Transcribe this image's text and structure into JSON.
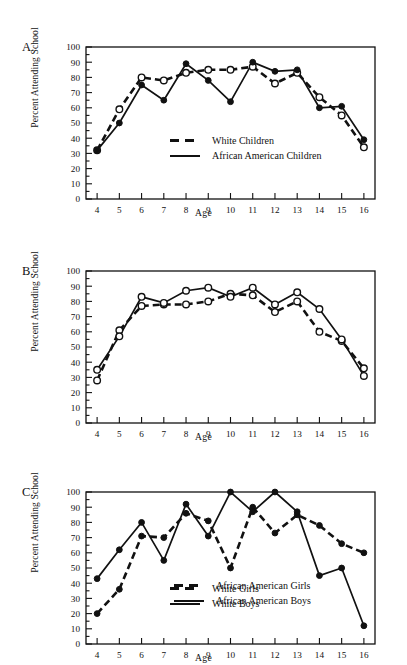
{
  "figure": {
    "panels": [
      {
        "letter": "A.",
        "ylabel": "Percent Attending School",
        "xlabel": "Age"
      },
      {
        "letter": "B.",
        "ylabel": "Percent Attending School",
        "xlabel": "Age"
      },
      {
        "letter": "C.",
        "ylabel": "Percent Attending School",
        "xlabel": "Age"
      }
    ]
  },
  "chart_data": [
    {
      "type": "line",
      "panel": "A.",
      "title": "",
      "xlabel": "Age",
      "ylabel": "Percent Attending School",
      "x": [
        4,
        5,
        6,
        7,
        8,
        9,
        10,
        11,
        12,
        13,
        14,
        15,
        16
      ],
      "xticklabels": [
        "4",
        "5",
        "6",
        "7",
        "8",
        "9",
        "10",
        "11",
        "12",
        "13",
        "14",
        "15",
        "16"
      ],
      "yticklabels": [
        "0",
        "10",
        "20",
        "30",
        "40",
        "50",
        "60",
        "70",
        "80",
        "90",
        "100"
      ],
      "xlim": [
        3.5,
        16.5
      ],
      "ylim": [
        0,
        100
      ],
      "grid": false,
      "legend_position": "center",
      "series": [
        {
          "name": "White Children",
          "style": "dashed",
          "marker": "open-circle",
          "values": [
            32,
            59,
            80,
            78,
            83,
            85,
            85,
            87,
            76,
            83,
            67,
            55,
            34
          ]
        },
        {
          "name": "African American Children",
          "style": "solid",
          "marker": "filled-circle",
          "values": [
            32,
            50,
            75,
            65,
            89,
            78,
            64,
            90,
            84,
            85,
            60,
            61,
            39
          ]
        }
      ]
    },
    {
      "type": "line",
      "panel": "B.",
      "title": "",
      "xlabel": "Age",
      "ylabel": "Percent Attending School",
      "x": [
        4,
        5,
        6,
        7,
        8,
        9,
        10,
        11,
        12,
        13,
        14,
        15,
        16
      ],
      "xticklabels": [
        "4",
        "5",
        "6",
        "7",
        "8",
        "9",
        "10",
        "11",
        "12",
        "13",
        "14",
        "15",
        "16"
      ],
      "yticklabels": [
        "0",
        "10",
        "20",
        "30",
        "40",
        "50",
        "60",
        "70",
        "80",
        "90",
        "100"
      ],
      "xlim": [
        3.5,
        16.5
      ],
      "ylim": [
        0,
        100
      ],
      "grid": false,
      "legend_position": "center",
      "series": [
        {
          "name": "White Girls",
          "style": "dashed",
          "marker": "open-circle",
          "values": [
            28,
            61,
            77,
            78,
            78,
            80,
            85,
            84,
            73,
            80,
            60,
            54,
            36
          ]
        },
        {
          "name": "White Boys",
          "style": "solid",
          "marker": "open-circle",
          "values": [
            35,
            57,
            83,
            79,
            87,
            89,
            83,
            89,
            78,
            86,
            75,
            55,
            31
          ]
        }
      ]
    },
    {
      "type": "line",
      "panel": "C.",
      "title": "",
      "xlabel": "Age",
      "ylabel": "Percent Attending School",
      "x": [
        4,
        5,
        6,
        7,
        8,
        9,
        10,
        11,
        12,
        13,
        14,
        15,
        16
      ],
      "xticklabels": [
        "4",
        "5",
        "6",
        "7",
        "8",
        "9",
        "10",
        "11",
        "12",
        "13",
        "14",
        "15",
        "16"
      ],
      "yticklabels": [
        "0",
        "10",
        "20",
        "30",
        "40",
        "50",
        "60",
        "70",
        "80",
        "90",
        "100"
      ],
      "xlim": [
        3.5,
        16.5
      ],
      "ylim": [
        0,
        100
      ],
      "grid": false,
      "legend_position": "center",
      "series": [
        {
          "name": "African American Girls",
          "style": "dashed",
          "marker": "filled-circle",
          "values": [
            20,
            36,
            71,
            70,
            86,
            81,
            50,
            90,
            73,
            85,
            78,
            66,
            60
          ]
        },
        {
          "name": "African American Boys",
          "style": "solid",
          "marker": "filled-circle",
          "values": [
            43,
            62,
            80,
            55,
            92,
            71,
            100,
            87,
            100,
            87,
            45,
            50,
            12
          ]
        }
      ]
    }
  ]
}
